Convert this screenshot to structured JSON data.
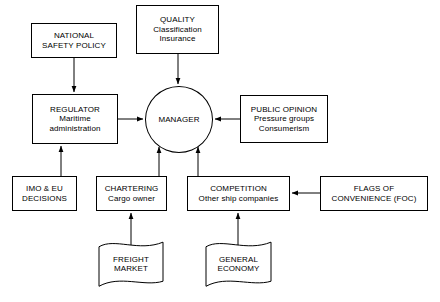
{
  "diagram": {
    "background_color": "#ffffff",
    "line_color": "#000000",
    "text_color": "#000000",
    "nodes": [
      {
        "id": "national-safety-policy",
        "shape": "box",
        "lines": [
          "NATIONAL",
          "SAFETY POLICY"
        ],
        "x": 31,
        "y": 23,
        "w": 86,
        "h": 35
      },
      {
        "id": "quality",
        "shape": "box",
        "lines": [
          "QUALITY",
          "Classification",
          "Insurance"
        ],
        "x": 136,
        "y": 5,
        "w": 83,
        "h": 49
      },
      {
        "id": "regulator",
        "shape": "box",
        "lines": [
          "REGULATOR",
          "Maritime",
          "administration"
        ],
        "x": 32,
        "y": 94,
        "w": 86,
        "h": 50
      },
      {
        "id": "manager",
        "shape": "ellipse",
        "lines": [
          "MANAGER"
        ],
        "x": 145,
        "y": 86,
        "w": 68,
        "h": 67
      },
      {
        "id": "public-opinion",
        "shape": "box",
        "lines": [
          "PUBLIC OPINION",
          "Pressure groups",
          "Consumerism"
        ],
        "x": 240,
        "y": 95,
        "w": 88,
        "h": 48
      },
      {
        "id": "imo-eu-decisions",
        "shape": "box",
        "lines": [
          "IMO & EU",
          "DECISIONS"
        ],
        "x": 12,
        "y": 176,
        "w": 65,
        "h": 35
      },
      {
        "id": "chartering",
        "shape": "box",
        "lines": [
          "CHARTERING",
          "Cargo owner"
        ],
        "x": 96,
        "y": 176,
        "w": 71,
        "h": 35
      },
      {
        "id": "competition",
        "shape": "box",
        "lines": [
          "COMPETITION",
          "Other ship companies"
        ],
        "x": 187,
        "y": 176,
        "w": 103,
        "h": 35
      },
      {
        "id": "flags-of-convenience",
        "shape": "box",
        "lines": [
          "FLAGS OF",
          "CONVENIENCE (FOC)"
        ],
        "x": 320,
        "y": 176,
        "w": 108,
        "h": 35
      },
      {
        "id": "freight-market",
        "shape": "flag",
        "lines": [
          "FREIGHT",
          "MARKET"
        ],
        "x": 98,
        "y": 240,
        "w": 66,
        "h": 48
      },
      {
        "id": "general-economy",
        "shape": "flag",
        "lines": [
          "GENERAL",
          "ECONOMY"
        ],
        "x": 205,
        "y": 240,
        "w": 67,
        "h": 48
      }
    ],
    "edges": [
      {
        "id": "edge-national-safety-policy-to-regulator",
        "from": "national-safety-policy",
        "to": "regulator",
        "points": [
          [
            74,
            58
          ],
          [
            74,
            92
          ]
        ],
        "arrow_at_end": true
      },
      {
        "id": "edge-quality-to-manager",
        "from": "quality",
        "to": "manager",
        "points": [
          [
            178,
            54
          ],
          [
            178,
            84
          ]
        ],
        "arrow_at_end": true
      },
      {
        "id": "edge-regulator-to-manager",
        "from": "regulator",
        "to": "manager",
        "points": [
          [
            118,
            119
          ],
          [
            143,
            119
          ]
        ],
        "arrow_at_end": true
      },
      {
        "id": "edge-public-opinion-to-manager",
        "from": "public-opinion",
        "to": "manager",
        "points": [
          [
            240,
            119
          ],
          [
            215,
            119
          ]
        ],
        "arrow_at_end": true
      },
      {
        "id": "edge-imo-eu-decisions-to-regulator",
        "from": "imo-eu-decisions",
        "to": "regulator",
        "points": [
          [
            61,
            176
          ],
          [
            61,
            146
          ]
        ],
        "arrow_at_end": true
      },
      {
        "id": "edge-chartering-to-manager",
        "from": "chartering",
        "to": "manager",
        "points": [
          [
            159,
            176
          ],
          [
            159,
            147
          ]
        ],
        "arrow_at_end": true
      },
      {
        "id": "edge-competition-to-manager",
        "from": "competition",
        "to": "manager",
        "points": [
          [
            198,
            176
          ],
          [
            198,
            147
          ]
        ],
        "arrow_at_end": true
      },
      {
        "id": "edge-flags-of-convenience-to-competition",
        "from": "flags-of-convenience",
        "to": "competition",
        "points": [
          [
            320,
            193
          ],
          [
            292,
            193
          ]
        ],
        "arrow_at_end": true
      },
      {
        "id": "edge-freight-market-to-chartering",
        "from": "freight-market",
        "to": "chartering",
        "points": [
          [
            131,
            245
          ],
          [
            131,
            213
          ]
        ],
        "arrow_at_end": true
      },
      {
        "id": "edge-general-economy-to-competition",
        "from": "general-economy",
        "to": "competition",
        "points": [
          [
            238,
            245
          ],
          [
            238,
            213
          ]
        ],
        "arrow_at_end": true
      }
    ]
  }
}
